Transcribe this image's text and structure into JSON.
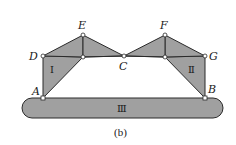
{
  "figure": {
    "caption": "(b)",
    "colors": {
      "fill": "#a0a0a0",
      "stroke": "#2a2a2a",
      "joint": "#ffffff",
      "background": "#ffffff"
    },
    "points": {
      "A": {
        "label": "A",
        "x": 43,
        "y": 98
      },
      "B": {
        "label": "B",
        "x": 205,
        "y": 98
      },
      "C": {
        "label": "C",
        "x": 124,
        "y": 56
      },
      "D": {
        "label": "D",
        "x": 43,
        "y": 56
      },
      "E": {
        "label": "E",
        "x": 83,
        "y": 35
      },
      "F": {
        "label": "F",
        "x": 165,
        "y": 35
      },
      "G": {
        "label": "G",
        "x": 205,
        "y": 56
      }
    },
    "bodies": [
      {
        "id": "I",
        "label": "Ⅰ"
      },
      {
        "id": "II",
        "label": "Ⅱ"
      },
      {
        "id": "III",
        "label": "Ⅲ"
      }
    ]
  }
}
